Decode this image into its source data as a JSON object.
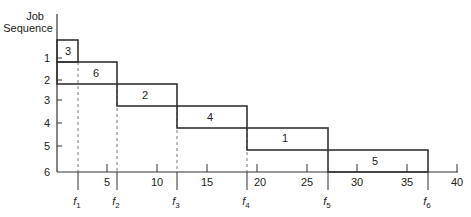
{
  "y_axis": {
    "label_line1": "Job",
    "label_line2": "Sequence",
    "ticks": [
      "1",
      "2",
      "3",
      "4",
      "5",
      "6"
    ]
  },
  "x_axis": {
    "ticks": [
      "5",
      "10",
      "15",
      "20",
      "25",
      "30",
      "35",
      "40"
    ]
  },
  "jobs": [
    {
      "label": "3",
      "start": 0,
      "end": 3
    },
    {
      "label": "6",
      "start": 3,
      "end": 6
    },
    {
      "label": "2",
      "start": 6,
      "end": 12
    },
    {
      "label": "4",
      "start": 12,
      "end": 19
    },
    {
      "label": "1",
      "start": 19,
      "end": 27
    },
    {
      "label": "5",
      "start": 27,
      "end": 37
    }
  ],
  "finish_markers": [
    {
      "name": "f",
      "sub": "1",
      "value": 3
    },
    {
      "name": "f",
      "sub": "2",
      "value": 6
    },
    {
      "name": "f",
      "sub": "3",
      "value": 12
    },
    {
      "name": "f",
      "sub": "4",
      "value": 19
    },
    {
      "name": "f",
      "sub": "5",
      "value": 27
    },
    {
      "name": "f",
      "sub": "6",
      "value": 37
    }
  ]
}
